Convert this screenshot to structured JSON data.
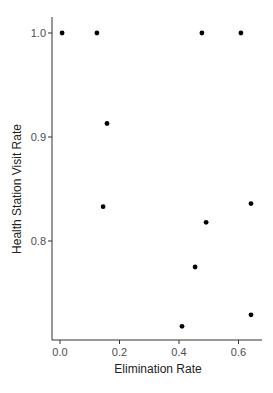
{
  "chart_data": {
    "type": "scatter",
    "title": "",
    "xlabel": "Elimination Rate",
    "ylabel": "Health Station Visit Rate",
    "xlim": [
      -0.02,
      0.67
    ],
    "ylim": [
      0.705,
      1.05
    ],
    "x_ticks": [
      0.0,
      0.2,
      0.4,
      0.6
    ],
    "x_tick_labels": [
      "0.0",
      "0.2",
      "0.4",
      "0.6"
    ],
    "y_ticks": [
      0.8,
      0.9,
      1.0
    ],
    "y_tick_labels": [
      "0.8",
      "0.9",
      "1.0"
    ],
    "grid": false,
    "legend": null,
    "point_color": "#000000",
    "points": [
      {
        "x": 0.007,
        "y": 1.0
      },
      {
        "x": 0.124,
        "y": 1.0
      },
      {
        "x": 0.477,
        "y": 1.0
      },
      {
        "x": 0.608,
        "y": 1.0
      },
      {
        "x": 0.158,
        "y": 0.913
      },
      {
        "x": 0.145,
        "y": 0.833
      },
      {
        "x": 0.642,
        "y": 0.836
      },
      {
        "x": 0.491,
        "y": 0.818
      },
      {
        "x": 0.454,
        "y": 0.775
      },
      {
        "x": 0.642,
        "y": 0.729
      },
      {
        "x": 0.41,
        "y": 0.718
      }
    ]
  }
}
